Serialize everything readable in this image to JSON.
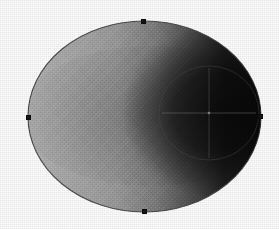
{
  "canvas": {
    "name": "ellipse-shading-canvas",
    "width": 279,
    "height": 229,
    "background_color": "#fefefe",
    "title": "Shaded ellipse with selection handles"
  },
  "shapes": {
    "outer_ellipse": {
      "label": "Outer ellipse",
      "cx": 144.5,
      "cy": 116.5,
      "rx": 116.5,
      "ry": 95.5,
      "stroke_color": "#4a4a4a",
      "gradient": {
        "type": "linear",
        "direction": "left-to-right",
        "stops": [
          {
            "offset": "0%",
            "color": "#b4b4b4"
          },
          {
            "offset": "18%",
            "color": "#a8a8a8"
          },
          {
            "offset": "38%",
            "color": "#9a9a9a"
          },
          {
            "offset": "55%",
            "color": "#7c7c7c"
          },
          {
            "offset": "70%",
            "color": "#4e4e4e"
          },
          {
            "offset": "84%",
            "color": "#232323"
          },
          {
            "offset": "100%",
            "color": "#121212"
          }
        ]
      },
      "shadow_overlay": {
        "label": "Radial shadow lobe",
        "cx": 214,
        "cy": 112,
        "rx": 92,
        "ry": 86,
        "color": "#000000",
        "max_opacity": 0.72
      }
    },
    "inner_ellipse": {
      "label": "Inner ellipse",
      "cx": 209,
      "cy": 113,
      "rx": 50,
      "ry": 47,
      "stroke_color": "#3a3a3a",
      "stroke_opacity": 0.45,
      "fill": "none"
    },
    "crosshair": {
      "label": "Center crosshair guides",
      "cx": 209,
      "cy": 113,
      "horizontal": {
        "x1": 162,
        "y1": 113,
        "x2": 256,
        "y2": 113
      },
      "vertical": {
        "x1": 209,
        "y1": 68,
        "x2": 209,
        "y2": 158
      },
      "stroke_color": "#9a9a9a",
      "stroke_opacity": 0.4
    }
  },
  "handles": [
    {
      "id": "handle-top",
      "label": "Top anchor handle",
      "x": 143,
      "y": 21,
      "color": "#141414"
    },
    {
      "id": "handle-left",
      "label": "Left anchor handle",
      "x": 28,
      "y": 117,
      "color": "#141414"
    },
    {
      "id": "handle-right",
      "label": "Right anchor handle",
      "x": 260,
      "y": 116,
      "color": "#141414"
    },
    {
      "id": "handle-bottom",
      "label": "Bottom anchor handle",
      "x": 144,
      "y": 211,
      "color": "#141414"
    }
  ],
  "chart_data": {
    "type": "scatter",
    "title": "Shaded ellipse with selection handles",
    "xlabel": "",
    "ylabel": "",
    "xlim": [
      0,
      279
    ],
    "ylim": [
      0,
      229
    ],
    "grid": false,
    "legend": "none",
    "annotations": [
      "Outer ellipse spans x 28-261, y 21-212",
      "Linear grayscale gradient from light gray at left to near-black at right",
      "Inner ellipse centered near (209, 113) with radius about 50 by 47",
      "Four square anchor handles at the ellipse cardinal points"
    ],
    "series": [
      {
        "name": "anchor handles",
        "x": [
          143,
          28,
          260,
          144
        ],
        "y": [
          21,
          117,
          116,
          211
        ]
      }
    ]
  }
}
